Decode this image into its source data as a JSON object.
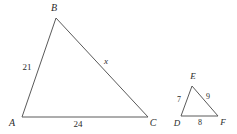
{
  "figure": {
    "background_color": "#ffffff",
    "stroke_color": "#5a5a5a",
    "text_color": "#2b2b2b",
    "width": 237,
    "height": 134
  },
  "triangles": [
    {
      "id": "large",
      "name": "triangle-abc",
      "vertices": [
        {
          "name": "A",
          "label": "A",
          "x": 22,
          "y": 117,
          "label_x": 12,
          "label_y": 123
        },
        {
          "name": "B",
          "label": "B",
          "x": 56,
          "y": 18,
          "label_x": 54,
          "label_y": 8
        },
        {
          "name": "C",
          "label": "C",
          "x": 148,
          "y": 117,
          "label_x": 153,
          "label_y": 123
        }
      ],
      "sides": [
        {
          "name": "AB",
          "label": "21",
          "is_variable": false,
          "label_x": 27,
          "label_y": 67
        },
        {
          "name": "BC",
          "label": "x",
          "is_variable": true,
          "label_x": 106,
          "label_y": 61
        },
        {
          "name": "AC",
          "label": "24",
          "is_variable": false,
          "label_x": 78,
          "label_y": 124
        }
      ]
    },
    {
      "id": "small",
      "name": "triangle-def",
      "vertices": [
        {
          "name": "D",
          "label": "D",
          "x": 181,
          "y": 116,
          "label_x": 177,
          "label_y": 123
        },
        {
          "name": "E",
          "label": "E",
          "x": 192,
          "y": 86,
          "label_x": 193,
          "label_y": 76
        },
        {
          "name": "F",
          "label": "F",
          "x": 218,
          "y": 116,
          "label_x": 223,
          "label_y": 122
        }
      ],
      "sides": [
        {
          "name": "DE",
          "label": "7",
          "is_variable": false,
          "label_x": 179,
          "label_y": 100
        },
        {
          "name": "EF",
          "label": "9",
          "is_variable": false,
          "label_x": 208,
          "label_y": 97
        },
        {
          "name": "DF",
          "label": "8",
          "is_variable": false,
          "label_x": 200,
          "label_y": 123
        }
      ]
    }
  ]
}
